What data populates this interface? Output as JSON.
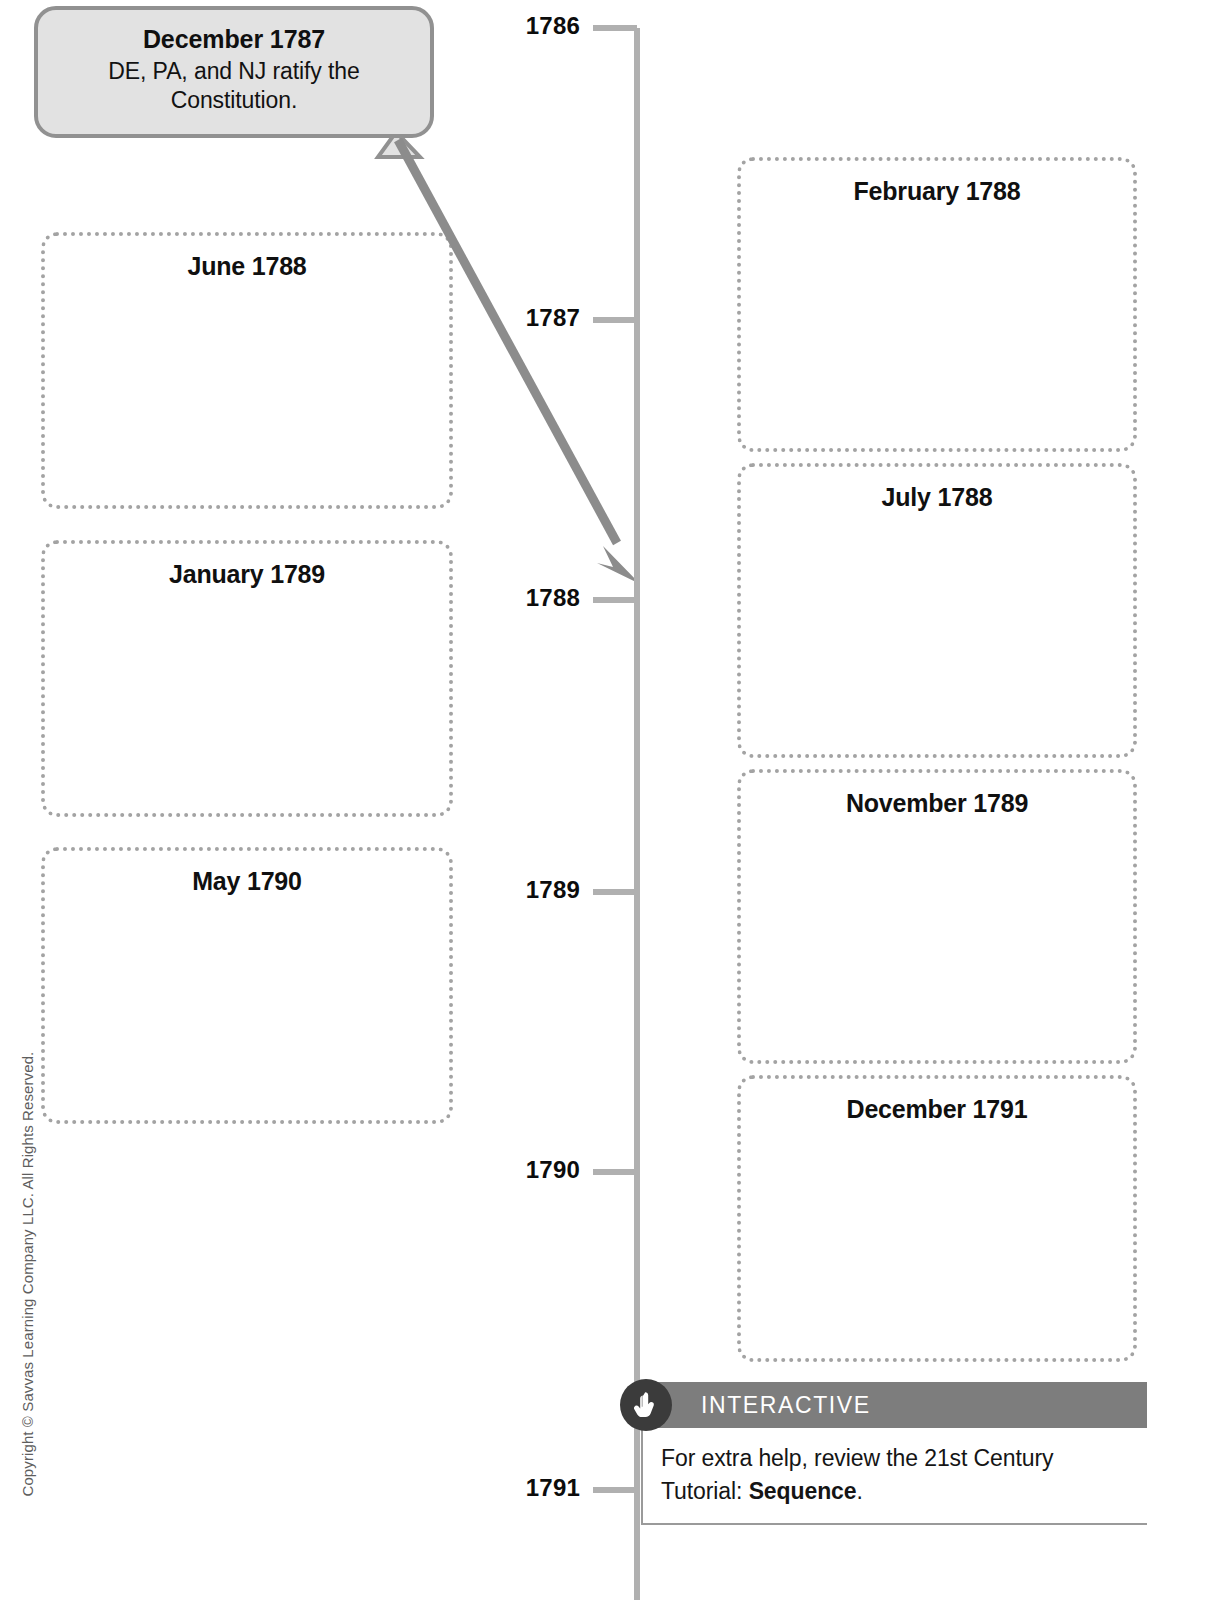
{
  "callout": {
    "title": "December 1787",
    "body": "DE, PA, and NJ ratify the Constitution.",
    "icon": "speech-bubble"
  },
  "timeline": {
    "years": [
      {
        "label": "1786",
        "y": 28
      },
      {
        "label": "1787",
        "y": 320
      },
      {
        "label": "1788",
        "y": 600
      },
      {
        "label": "1789",
        "y": 892
      },
      {
        "label": "1790",
        "y": 1172
      },
      {
        "label": "1791",
        "y": 1490
      }
    ],
    "axis_color": "#b0b0b0",
    "arrow_color": "#8c8c8c",
    "arrow_target_year": "1788"
  },
  "left_boxes": [
    {
      "label": "June 1788",
      "x": 41,
      "y": 232,
      "w": 412,
      "h": 277
    },
    {
      "label": "January 1789",
      "x": 41,
      "y": 540,
      "w": 412,
      "h": 277
    },
    {
      "label": "May 1790",
      "x": 41,
      "y": 847,
      "w": 412,
      "h": 277
    }
  ],
  "right_boxes": [
    {
      "label": "February 1788",
      "x": 737,
      "y": 157,
      "w": 400,
      "h": 295
    },
    {
      "label": "July 1788",
      "x": 737,
      "y": 463,
      "w": 400,
      "h": 295
    },
    {
      "label": "November 1789",
      "x": 737,
      "y": 769,
      "w": 400,
      "h": 295
    },
    {
      "label": "December 1791",
      "x": 737,
      "y": 1075,
      "w": 400,
      "h": 287
    }
  ],
  "interactive": {
    "bar_label": "INTERACTIVE",
    "icon": "pointing-hand-icon",
    "text_before": "For extra help, review the 21st Century Tutorial: ",
    "text_bold": "Sequence",
    "text_after": "."
  },
  "copyright": {
    "text": "Copyright © Savvas Learning Company LLC. All Rights Reserved."
  },
  "colors": {
    "bubble_fill": "#e2e2e2",
    "bubble_border": "#919191",
    "dotted_border": "#a3a3a3",
    "axis": "#b0b0b0",
    "interactive_bar": "#7d7d7d",
    "badge": "#3b3b3b"
  }
}
